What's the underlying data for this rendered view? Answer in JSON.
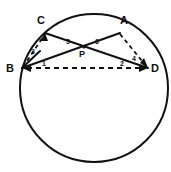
{
  "figure": {
    "background_color": "#ffffff",
    "stroke_color": "#111111"
  },
  "circle": {
    "center_x": 94,
    "center_y": 88,
    "radius": 74
  },
  "points": [
    {
      "id": "C",
      "label": "C",
      "x": 45,
      "y": 33,
      "label_x": 41,
      "label_y": 24
    },
    {
      "id": "A",
      "label": "A",
      "x": 120,
      "y": 33,
      "label_x": 124,
      "label_y": 24
    },
    {
      "id": "B",
      "label": "B",
      "x": 22,
      "y": 68,
      "label_x": 10,
      "label_y": 72
    },
    {
      "id": "D",
      "label": "D",
      "x": 148,
      "y": 68,
      "label_x": 153,
      "label_y": 72
    },
    {
      "id": "P",
      "label": "P",
      "x": 84,
      "y": 47,
      "label_x": 80,
      "label_y": 56
    }
  ],
  "segments": [
    {
      "id": "CD",
      "from": "C",
      "to": "D",
      "style": "solid",
      "arrows": "none"
    },
    {
      "id": "AB",
      "from": "A",
      "to": "B",
      "style": "solid",
      "arrows": "none"
    },
    {
      "id": "BC",
      "from": "B",
      "to": "C",
      "style": "dashed",
      "arrows": "end"
    },
    {
      "id": "AD",
      "from": "A",
      "to": "D",
      "style": "dashed",
      "arrows": "end"
    },
    {
      "id": "BD",
      "from": "B",
      "to": "D",
      "style": "dashed",
      "arrows": "both"
    }
  ],
  "angle_labels": [
    {
      "id": "angle-1",
      "label": "1",
      "x": 44,
      "y": 66,
      "description": "angle at B between BD and BA"
    },
    {
      "id": "angle-2",
      "label": "2",
      "x": 122,
      "y": 66,
      "description": "angle at D between DB and DC"
    },
    {
      "id": "angle-3",
      "label": "3",
      "x": 33,
      "y": 53,
      "description": "angle at B between BC and BA"
    },
    {
      "id": "angle-4",
      "label": "4",
      "x": 134,
      "y": 60,
      "description": "angle at D between DA and DC"
    },
    {
      "id": "angle-5",
      "label": "5",
      "x": 68,
      "y": 44,
      "description": "angle at P left side"
    },
    {
      "id": "angle-6",
      "label": "6",
      "x": 96,
      "y": 44,
      "description": "angle at P right side"
    }
  ]
}
